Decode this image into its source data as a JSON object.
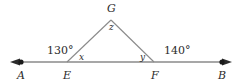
{
  "figure": {
    "type": "geometry-diagram",
    "width": 241,
    "height": 84,
    "stroke_color": "#808080",
    "text_color": "#2b2b2b",
    "background": "#ffffff"
  },
  "points": {
    "A": {
      "label": "A",
      "x": 21,
      "y": 62,
      "label_x": 17,
      "label_y": 70,
      "on_line": true,
      "dot": true
    },
    "E": {
      "label": "E",
      "x": 67,
      "y": 62,
      "label_x": 63,
      "label_y": 70,
      "on_line": true,
      "dot": false
    },
    "F": {
      "label": "F",
      "x": 154,
      "y": 62,
      "label_x": 151,
      "label_y": 70,
      "on_line": true,
      "dot": false
    },
    "B": {
      "label": "B",
      "x": 222,
      "y": 62,
      "label_x": 218,
      "label_y": 70,
      "on_line": true,
      "dot": true
    },
    "G": {
      "label": "G",
      "x": 111,
      "y": 20,
      "label_x": 107,
      "label_y": 3,
      "on_line": false,
      "dot": false
    }
  },
  "segments": [
    {
      "name": "line-AB",
      "from": "A-arrow-left",
      "to": "B-arrow-right",
      "x1": 12,
      "y1": 62,
      "x2": 230,
      "y2": 62,
      "arrows": "both"
    },
    {
      "name": "segment-EG",
      "from": "E",
      "to": "G",
      "x1": 67,
      "y1": 62,
      "x2": 111,
      "y2": 20,
      "arrows": "none"
    },
    {
      "name": "segment-GF",
      "from": "G",
      "to": "F",
      "x1": 111,
      "y1": 20,
      "x2": 154,
      "y2": 62,
      "arrows": "none"
    }
  ],
  "angles": [
    {
      "name": "angle-130",
      "label": "130°",
      "vertex": "E",
      "kind": "exterior-left",
      "label_x": 47,
      "label_y": 45
    },
    {
      "name": "angle-x",
      "label": "x",
      "vertex": "E",
      "kind": "interior",
      "label_x": 79,
      "label_y": 53
    },
    {
      "name": "angle-z",
      "label": "z",
      "vertex": "G",
      "kind": "apex",
      "label_x": 109,
      "label_y": 23
    },
    {
      "name": "angle-y",
      "label": "y",
      "vertex": "F",
      "kind": "interior",
      "label_x": 140,
      "label_y": 53
    },
    {
      "name": "angle-140",
      "label": "140°",
      "vertex": "F",
      "kind": "exterior-right",
      "label_x": 164,
      "label_y": 45
    }
  ]
}
